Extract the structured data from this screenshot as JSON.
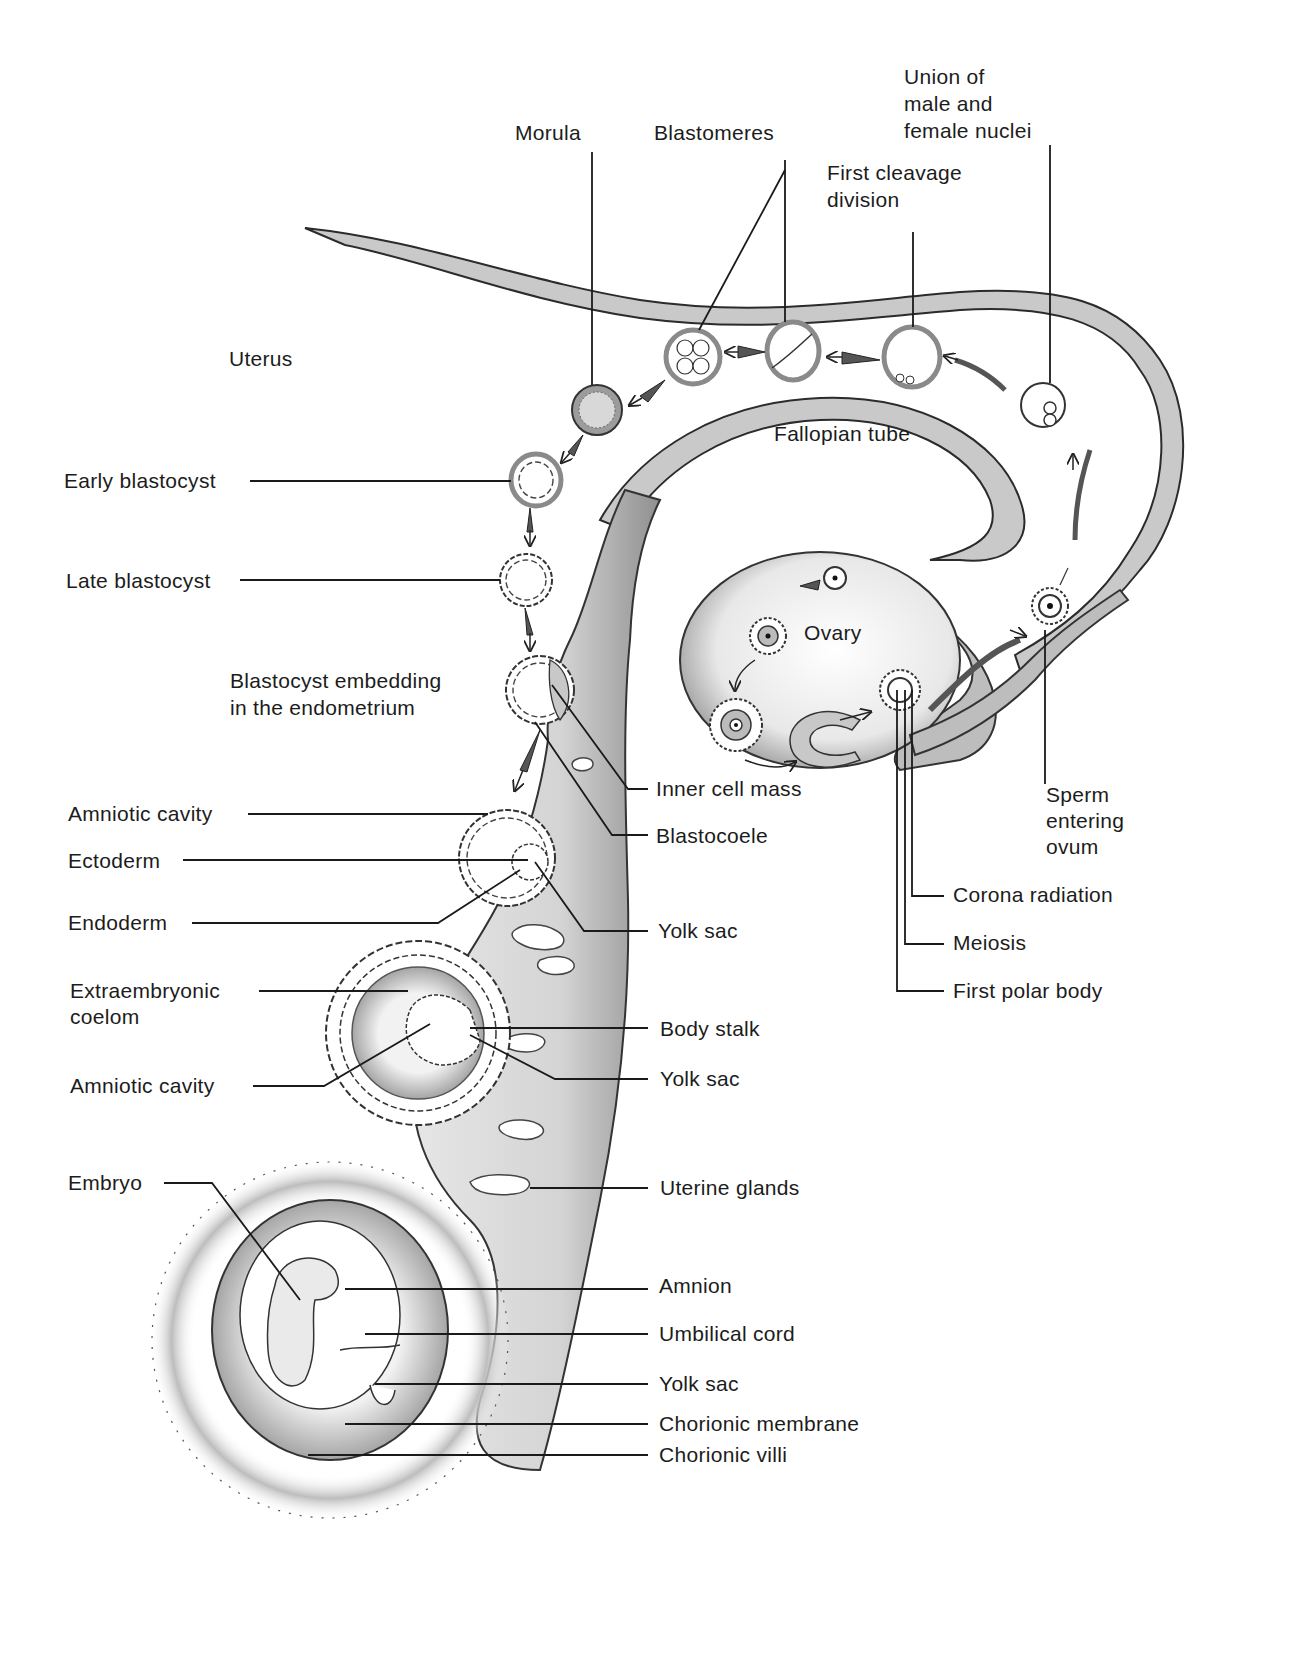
{
  "diagram": {
    "title_regions": {
      "uterus": "Uterus",
      "fallopian_tube": "Fallopian tube",
      "ovary": "Ovary"
    },
    "top_labels": {
      "morula": "Morula",
      "blastomeres": "Blastomeres",
      "union_line1": "Union of",
      "union_line2": "male and",
      "union_line3": "female nuclei",
      "first_cleavage_line1": "First cleavage",
      "first_cleavage_line2": "division"
    },
    "left_labels": {
      "early_blastocyst": "Early blastocyst",
      "late_blastocyst": "Late blastocyst",
      "embedding_line1": "Blastocyst embedding",
      "embedding_line2": "in the endometrium",
      "amniotic_cavity_1": "Amniotic cavity",
      "ectoderm": "Ectoderm",
      "endoderm": "Endoderm",
      "extraembryonic_line1": "Extraembryonic",
      "extraembryonic_line2": "coelom",
      "amniotic_cavity_2": "Amniotic cavity",
      "embryo": "Embryo"
    },
    "right_labels": {
      "inner_cell_mass": "Inner cell mass",
      "blastocoele": "Blastocoele",
      "yolk_sac_1": "Yolk sac",
      "body_stalk": "Body stalk",
      "yolk_sac_2": "Yolk sac",
      "uterine_glands": "Uterine glands",
      "amnion": "Amnion",
      "umbilical_cord": "Umbilical cord",
      "yolk_sac_3": "Yolk sac",
      "chorionic_membrane": "Chorionic membrane",
      "chorionic_villi": "Chorionic villi"
    },
    "ovary_labels": {
      "sperm_line1": "Sperm",
      "sperm_line2": "entering",
      "sperm_line3": "ovum",
      "corona_radiation": "Corona radiation",
      "meiosis": "Meiosis",
      "first_polar_body": "First polar body"
    }
  }
}
